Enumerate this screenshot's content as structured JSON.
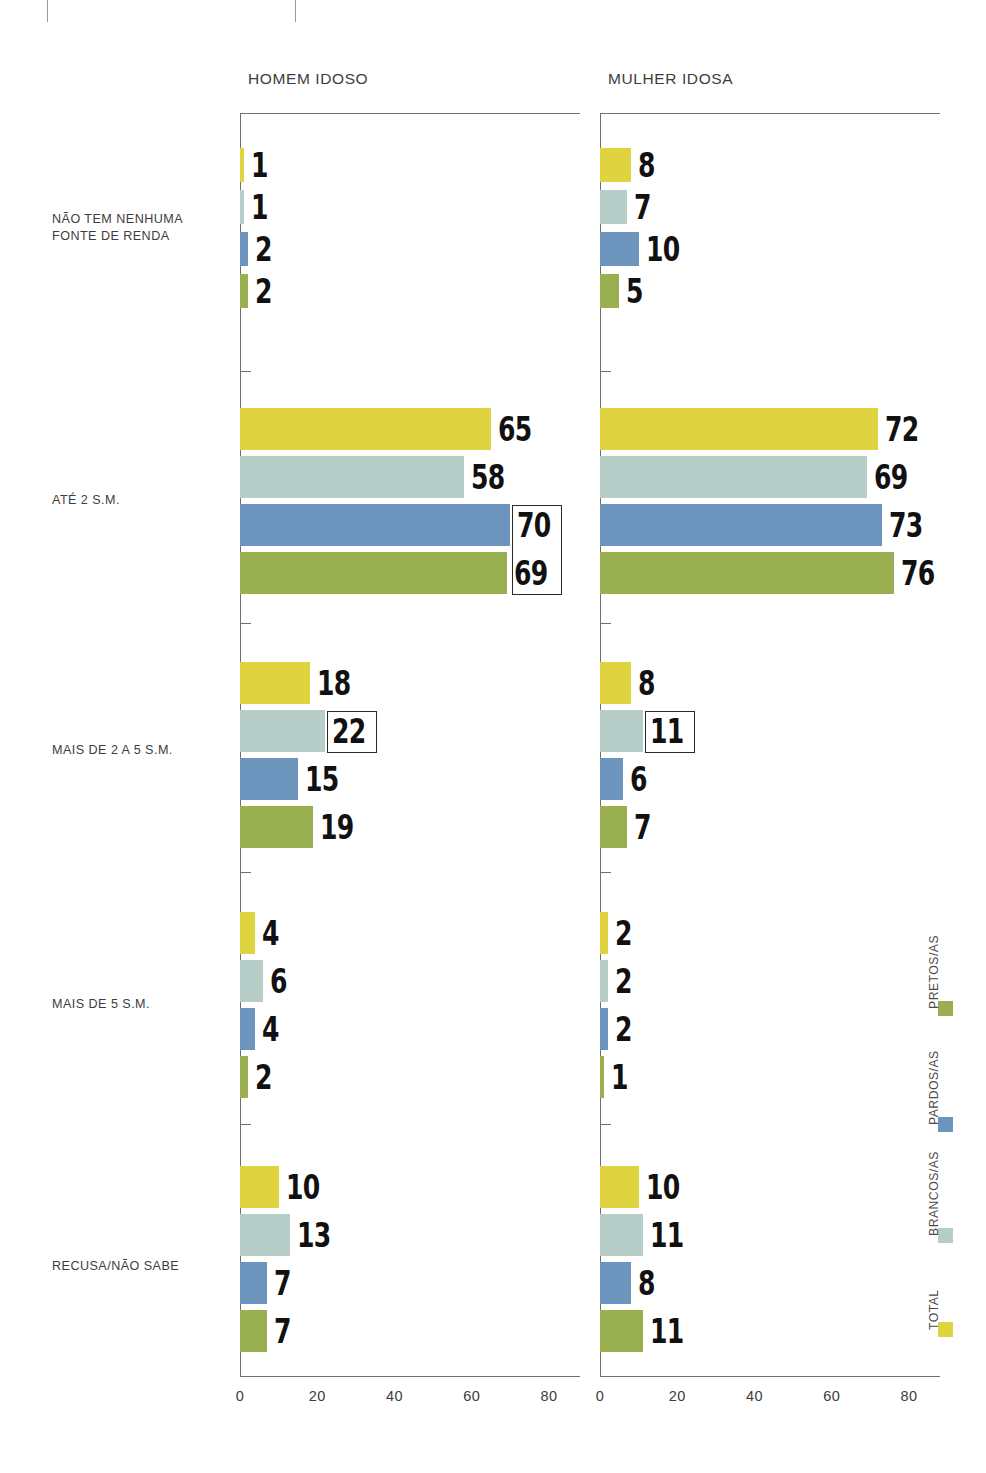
{
  "panels": [
    {
      "title": "HOMEM IDOSO"
    },
    {
      "title": "MULHER IDOSA"
    }
  ],
  "categories": [
    "NÃO TEM NENHUMA\nFONTE DE RENDA",
    "ATÉ 2 S.M.",
    "MAIS DE 2 A 5 S.M.",
    "MAIS DE 5 S.M.",
    "RECUSA/NÃO SABE"
  ],
  "legend": [
    {
      "label": "PRETOS/AS",
      "color": "#9aaf50"
    },
    {
      "label": "PARDOS/AS",
      "color": "#6d94bc"
    },
    {
      "label": "BRANCOS/AS",
      "color": "#b7cdc8"
    },
    {
      "label": "TOTAL",
      "color": "#dfd43f"
    }
  ],
  "xticks": [
    "0",
    "20",
    "40",
    "60",
    "80"
  ],
  "colors": {
    "total": "#dfd43f",
    "brancos": "#b7cdc8",
    "pardos": "#6d94bc",
    "pretos": "#9aaf50",
    "axis": "#6f6f6f",
    "text": "#3d3d3d",
    "value": "#111111",
    "highlight_border": "#2a2a2a"
  },
  "chart_data": {
    "type": "bar",
    "title": "",
    "xlabel": "",
    "ylabel": "",
    "xlim": [
      0,
      88
    ],
    "grid": false,
    "legend_position": "right-vertical",
    "orientation": "horizontal",
    "categories": [
      "NÃO TEM NENHUMA FONTE DE RENDA",
      "ATÉ 2 S.M.",
      "MAIS DE 2 A 5 S.M.",
      "MAIS DE 5 S.M.",
      "RECUSA/NÃO SABE"
    ],
    "panels": [
      {
        "name": "HOMEM IDOSO",
        "series": [
          {
            "name": "TOTAL",
            "values": [
              1,
              65,
              18,
              4,
              10
            ]
          },
          {
            "name": "BRANCOS/AS",
            "values": [
              1,
              58,
              22,
              6,
              13
            ]
          },
          {
            "name": "PARDOS/AS",
            "values": [
              2,
              70,
              15,
              4,
              7
            ]
          },
          {
            "name": "PRETOS/AS",
            "values": [
              2,
              69,
              19,
              2,
              7
            ]
          }
        ],
        "highlighted": [
          {
            "category": "ATÉ 2 S.M.",
            "series": [
              "PARDOS/AS",
              "PRETOS/AS"
            ],
            "values": [
              70,
              69
            ]
          },
          {
            "category": "MAIS DE 2 A 5 S.M.",
            "series": [
              "BRANCOS/AS"
            ],
            "values": [
              22
            ]
          }
        ]
      },
      {
        "name": "MULHER IDOSA",
        "series": [
          {
            "name": "TOTAL",
            "values": [
              8,
              72,
              8,
              2,
              10
            ]
          },
          {
            "name": "BRANCOS/AS",
            "values": [
              7,
              69,
              11,
              2,
              11
            ]
          },
          {
            "name": "PARDOS/AS",
            "values": [
              10,
              73,
              6,
              2,
              8
            ]
          },
          {
            "name": "PRETOS/AS",
            "values": [
              5,
              76,
              7,
              1,
              11
            ]
          }
        ],
        "highlighted": [
          {
            "category": "MAIS DE 2 A 5 S.M.",
            "series": [
              "BRANCOS/AS"
            ],
            "values": [
              11
            ]
          }
        ]
      }
    ],
    "xticks": [
      0,
      20,
      40,
      60,
      80
    ]
  }
}
